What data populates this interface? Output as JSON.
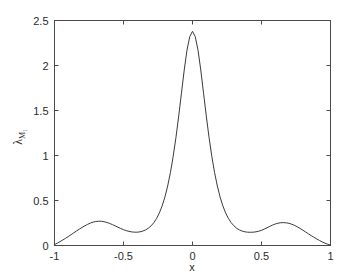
{
  "figure": {
    "background_color": "#ffffff",
    "axis_color": "#4a4a4a",
    "curve_color": "#3a3a3a"
  },
  "chart_data": {
    "type": "line",
    "title": "",
    "subtitle": "",
    "xlabel": "x",
    "ylabel": "λ",
    "ylabel_subscript": "M₁",
    "xlim": [
      -1,
      1
    ],
    "ylim": [
      0,
      2.5
    ],
    "grid": false,
    "legend": null,
    "legend_position": "none",
    "xticks": [
      -1,
      -0.5,
      0,
      0.5,
      1
    ],
    "xtick_labels": [
      "-1",
      "-0.5",
      "0",
      "0.5",
      "1"
    ],
    "yticks": [
      0,
      0.5,
      1,
      1.5,
      2,
      2.5
    ],
    "ytick_labels": [
      "0",
      "0.5",
      "1",
      "1.5",
      "2",
      "2.5"
    ],
    "box": true,
    "tick_direction": "in",
    "annotations": [],
    "series": [
      {
        "name": "lambda_M1",
        "x": [
          -1.0,
          -0.98,
          -0.96,
          -0.94,
          -0.92,
          -0.9,
          -0.88,
          -0.86,
          -0.84,
          -0.82,
          -0.8,
          -0.78,
          -0.76,
          -0.74,
          -0.72,
          -0.7,
          -0.68,
          -0.66,
          -0.64,
          -0.62,
          -0.6,
          -0.58,
          -0.56,
          -0.54,
          -0.52,
          -0.5,
          -0.48,
          -0.46,
          -0.44,
          -0.42,
          -0.4,
          -0.38,
          -0.36,
          -0.34,
          -0.32,
          -0.3,
          -0.28,
          -0.26,
          -0.24,
          -0.22,
          -0.2,
          -0.18,
          -0.16,
          -0.14,
          -0.12,
          -0.1,
          -0.08,
          -0.06,
          -0.04,
          -0.02,
          0.0,
          0.02,
          0.04,
          0.06,
          0.08,
          0.1,
          0.12,
          0.14,
          0.16,
          0.18,
          0.2,
          0.22,
          0.24,
          0.26,
          0.28,
          0.3,
          0.32,
          0.34,
          0.36,
          0.38,
          0.4,
          0.42,
          0.44,
          0.46,
          0.48,
          0.5,
          0.52,
          0.54,
          0.56,
          0.58,
          0.6,
          0.62,
          0.64,
          0.66,
          0.68,
          0.7,
          0.72,
          0.74,
          0.76,
          0.78,
          0.8,
          0.82,
          0.84,
          0.86,
          0.88,
          0.9,
          0.92,
          0.94,
          0.96,
          0.98,
          1.0
        ],
        "y": [
          0.01,
          0.026,
          0.043,
          0.061,
          0.08,
          0.1,
          0.12,
          0.141,
          0.162,
          0.182,
          0.201,
          0.219,
          0.235,
          0.249,
          0.26,
          0.267,
          0.27,
          0.269,
          0.264,
          0.256,
          0.245,
          0.232,
          0.218,
          0.203,
          0.189,
          0.176,
          0.165,
          0.157,
          0.151,
          0.148,
          0.148,
          0.152,
          0.16,
          0.173,
          0.192,
          0.219,
          0.254,
          0.301,
          0.362,
          0.44,
          0.538,
          0.661,
          0.81,
          0.99,
          1.2,
          1.438,
          1.693,
          1.95,
          2.17,
          2.32,
          2.38,
          2.32,
          2.17,
          1.95,
          1.693,
          1.438,
          1.2,
          0.99,
          0.81,
          0.661,
          0.538,
          0.44,
          0.362,
          0.301,
          0.254,
          0.219,
          0.192,
          0.173,
          0.16,
          0.152,
          0.148,
          0.147,
          0.148,
          0.152,
          0.159,
          0.169,
          0.182,
          0.197,
          0.212,
          0.227,
          0.239,
          0.248,
          0.253,
          0.254,
          0.252,
          0.246,
          0.236,
          0.223,
          0.207,
          0.189,
          0.17,
          0.15,
          0.13,
          0.11,
          0.091,
          0.073,
          0.056,
          0.04,
          0.026,
          0.014,
          0.005
        ]
      }
    ],
    "features": {
      "center_peak_x": 0.0,
      "center_peak_y": 2.38,
      "left_bump_x": -0.68,
      "left_bump_y": 0.27,
      "right_bump_x": 0.66,
      "right_bump_y": 0.254,
      "left_valley_x": -0.43,
      "left_valley_y": 0.148,
      "right_valley_x": 0.42,
      "right_valley_y": 0.147,
      "endpoint_left_y": 0.01,
      "endpoint_right_y": 0.005
    }
  }
}
